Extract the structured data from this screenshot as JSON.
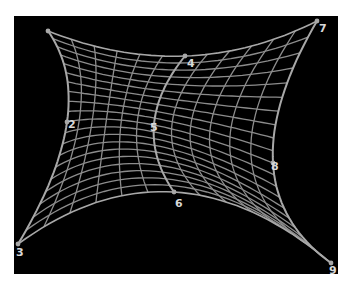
{
  "diagram": {
    "type": "bezier-surface-patch",
    "background_color": "#000000",
    "mesh_color": "#8c8c8c",
    "edge_color": "#a8a8a8",
    "label_color": "#d8d8d8",
    "grid": {
      "u_divisions": 12,
      "v_divisions": 20
    },
    "control_points": [
      [
        {
          "id": 1,
          "x": 48,
          "y": 31,
          "label": ""
        },
        {
          "id": 4,
          "x": 185,
          "y": 56,
          "label": "4"
        },
        {
          "id": 7,
          "x": 317,
          "y": 21,
          "label": "7"
        }
      ],
      [
        {
          "id": 2,
          "x": 67,
          "y": 122,
          "label": "2"
        },
        {
          "id": 5,
          "x": 154,
          "y": 125,
          "label": "5"
        },
        {
          "id": 8,
          "x": 273,
          "y": 163,
          "label": "8"
        }
      ],
      [
        {
          "id": 3,
          "x": 18,
          "y": 244,
          "label": "3"
        },
        {
          "id": 6,
          "x": 174,
          "y": 192,
          "label": "6"
        },
        {
          "id": 9,
          "x": 331,
          "y": 263,
          "label": "9"
        }
      ]
    ],
    "label_offsets": {
      "1": [
        3,
        5
      ],
      "2": [
        1,
        6
      ],
      "3": [
        -2,
        12
      ],
      "4": [
        2,
        11
      ],
      "5": [
        -4,
        6
      ],
      "6": [
        1,
        15
      ],
      "7": [
        2,
        11
      ],
      "8": [
        -2,
        7
      ],
      "9": [
        -2,
        11
      ]
    }
  }
}
